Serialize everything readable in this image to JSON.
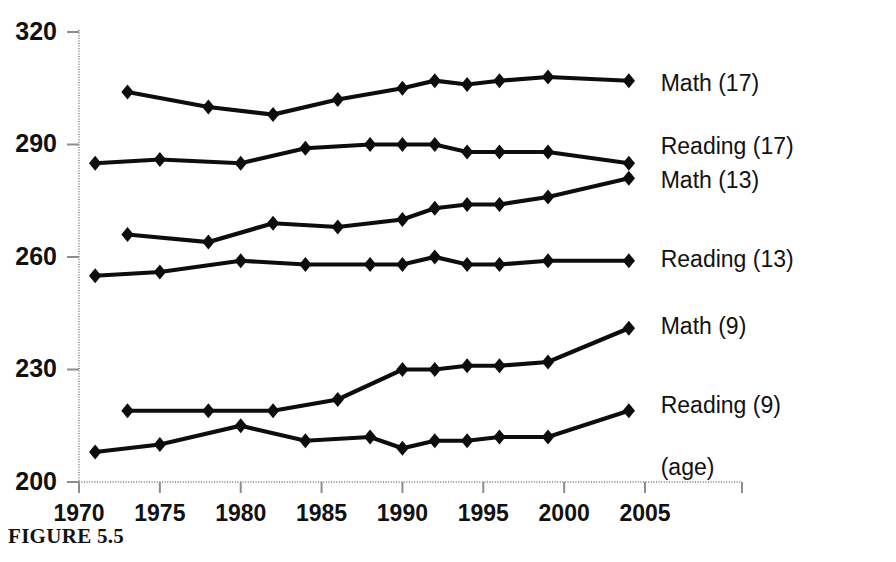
{
  "figure": {
    "caption": "FIGURE 5.5",
    "age_note": "(age)"
  },
  "chart_data": {
    "type": "line",
    "title": "",
    "subtitle": "",
    "xlabel": "",
    "ylabel": "",
    "xlim": [
      1970,
      2005
    ],
    "ylim": [
      200,
      320
    ],
    "yticks": [
      200,
      230,
      260,
      290,
      320
    ],
    "ytick_labels": [
      "200",
      "230",
      "260",
      "290",
      "320"
    ],
    "xticks": [
      1970,
      1975,
      1980,
      1985,
      1990,
      1995,
      2000,
      2005
    ],
    "xtick_labels": [
      "1970",
      "1975",
      "1980",
      "1985",
      "1990",
      "1995",
      "2000",
      "2005"
    ],
    "grid": false,
    "legend_position": "right-inline",
    "annotations": [
      "(age)"
    ],
    "series": [
      {
        "name": "Math (17)",
        "label": "Math (17)",
        "label_x": 2005.6,
        "label_y": 306,
        "marker": "diamond",
        "x": [
          1973,
          1978,
          1982,
          1986,
          1990,
          1992,
          1994,
          1996,
          1999,
          2004
        ],
        "y": [
          304,
          300,
          298,
          302,
          305,
          307,
          306,
          307,
          308,
          307
        ]
      },
      {
        "name": "Reading (17)",
        "label": "Reading (17)",
        "label_x": 2005.6,
        "label_y": 289,
        "marker": "diamond",
        "x": [
          1971,
          1975,
          1980,
          1984,
          1988,
          1990,
          1992,
          1994,
          1996,
          1999,
          2004
        ],
        "y": [
          285,
          286,
          285,
          289,
          290,
          290,
          290,
          288,
          288,
          288,
          285
        ]
      },
      {
        "name": "Math (13)",
        "label": "Math (13)",
        "label_x": 2005.6,
        "label_y": 280,
        "marker": "diamond",
        "x": [
          1973,
          1978,
          1982,
          1986,
          1990,
          1992,
          1994,
          1996,
          1999,
          2004
        ],
        "y": [
          266,
          264,
          269,
          268,
          270,
          273,
          274,
          274,
          276,
          281
        ]
      },
      {
        "name": "Reading (13)",
        "label": "Reading (13)",
        "label_x": 2005.6,
        "label_y": 259,
        "marker": "diamond",
        "x": [
          1971,
          1975,
          1980,
          1984,
          1988,
          1990,
          1992,
          1994,
          1996,
          1999,
          2004
        ],
        "y": [
          255,
          256,
          259,
          258,
          258,
          258,
          260,
          258,
          258,
          259,
          259
        ]
      },
      {
        "name": "Math (9)",
        "label": "Math (9)",
        "label_x": 2005.6,
        "label_y": 241,
        "marker": "diamond",
        "x": [
          1973,
          1978,
          1982,
          1986,
          1990,
          1992,
          1994,
          1996,
          1999,
          2004
        ],
        "y": [
          219,
          219,
          219,
          222,
          230,
          230,
          231,
          231,
          232,
          241
        ]
      },
      {
        "name": "Reading (9)",
        "label": "Reading (9)",
        "label_x": 2005.6,
        "label_y": 220,
        "marker": "diamond",
        "x": [
          1971,
          1975,
          1980,
          1984,
          1988,
          1990,
          1992,
          1994,
          1996,
          1999,
          2004
        ],
        "y": [
          208,
          210,
          215,
          211,
          212,
          209,
          211,
          211,
          212,
          212,
          219
        ]
      }
    ]
  }
}
